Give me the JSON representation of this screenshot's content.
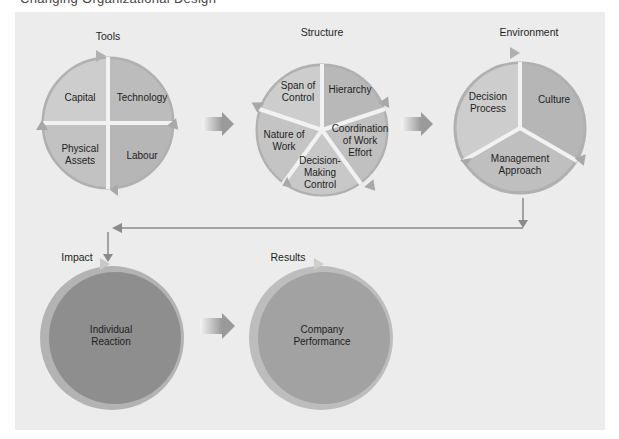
{
  "cropped_caption": "Changing Organizational Design",
  "groups": {
    "tools": {
      "title": "Tools",
      "segments": [
        "Capital",
        "Technology",
        "Physical\nAssets",
        "Labour"
      ]
    },
    "structure": {
      "title": "Structure",
      "segments": [
        "Span of\nControl",
        "Hierarchy",
        "Coordination\nof Work\nEffort",
        "Decision-\nMaking\nControl",
        "Nature of\nWork"
      ]
    },
    "environment": {
      "title": "Environment",
      "segments": [
        "Decision\nProcess",
        "Culture",
        "Management\nApproach"
      ]
    },
    "impact": {
      "title": "Impact",
      "label": "Individual\nReaction"
    },
    "results": {
      "title": "Results",
      "label": "Company\nPerformance"
    }
  },
  "colors": {
    "panel_bg": "#ececec",
    "segment_light": "#c9c9c9",
    "segment_mid": "#b5b5b5",
    "ring_arrow": "#a8a8a8",
    "impact_fill": "#8e8e8e",
    "results_fill": "#a2a2a2",
    "connector": "#8a8a8a"
  }
}
